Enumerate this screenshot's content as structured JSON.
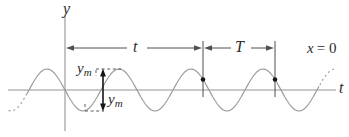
{
  "figure": {
    "colors": {
      "background": "#ffffff",
      "curve": "#9c9c9c",
      "axis": "#949494",
      "dimension": "#4f4f4f",
      "annotation": "#161616",
      "text": "#2b2b2b"
    },
    "labels": {
      "y_axis": "y",
      "t_axis": "t",
      "elapsed_time": "t",
      "period": "T",
      "position_variable": "x",
      "position_rest": "= 0",
      "amplitude_upper": {
        "base": "y",
        "sub": "m"
      },
      "amplitude_lower": {
        "base": "y",
        "sub": "m"
      }
    },
    "wave": {
      "center_y": 90,
      "amplitude": 21,
      "period": 72,
      "zero_cross_down_x": 65,
      "solid_start_x": 27,
      "solid_end_x": 320,
      "dotted_start_x": 9,
      "dotted_end_x": 336
    },
    "markers": {
      "tick1_x": 203,
      "tick2_x": 275,
      "tick_top_y": 41,
      "tick_bottom_y": 97,
      "dot_y": 79.5,
      "amplitude_arrow_x": 103,
      "crest_level_y": 69,
      "trough_level_y": 111
    }
  }
}
